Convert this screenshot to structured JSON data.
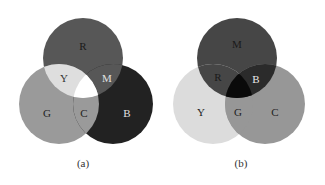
{
  "panels": [
    {
      "caption": "(a)",
      "model": "additive",
      "circles": [
        {
          "id": "R",
          "label": "R",
          "cx": 83,
          "cy": 58,
          "r": 40,
          "fill": "#575757"
        },
        {
          "id": "G",
          "label": "G",
          "cx": 59,
          "cy": 104,
          "r": 40,
          "fill": "#9a9a9a"
        },
        {
          "id": "B",
          "label": "B",
          "cx": 113,
          "cy": 104,
          "r": 40,
          "fill": "#222222"
        }
      ],
      "overlaps": {
        "RG": {
          "label": "Y",
          "fill": "#dedede"
        },
        "RB": {
          "label": "M",
          "fill": "#575757"
        },
        "GB": {
          "label": "C",
          "fill": "#9a9a9a"
        },
        "RGB": {
          "label": "",
          "fill": "#ffffff"
        }
      },
      "labels": [
        {
          "text": "R",
          "x": 83,
          "y": 46,
          "color": "#1a1a1a"
        },
        {
          "text": "Y",
          "x": 64,
          "y": 78,
          "color": "#333333"
        },
        {
          "text": "M",
          "x": 107,
          "y": 78,
          "color": "#e0e0e0"
        },
        {
          "text": "G",
          "x": 47,
          "y": 113,
          "color": "#222222"
        },
        {
          "text": "C",
          "x": 84,
          "y": 113,
          "color": "#222222"
        },
        {
          "text": "B",
          "x": 127,
          "y": 113,
          "color": "#e0e0e0"
        }
      ]
    },
    {
      "caption": "(b)",
      "model": "subtractive",
      "circles": [
        {
          "id": "M",
          "label": "M",
          "cx": 237,
          "cy": 58,
          "r": 40,
          "fill": "#464646"
        },
        {
          "id": "Y",
          "label": "Y",
          "cx": 213,
          "cy": 104,
          "r": 40,
          "fill": "#dcdcdc"
        },
        {
          "id": "C",
          "label": "C",
          "cx": 265,
          "cy": 104,
          "r": 40,
          "fill": "#979797"
        }
      ],
      "overlaps": {
        "MY": {
          "label": "R",
          "fill": "#464646"
        },
        "MC": {
          "label": "B",
          "fill": "#2b2b2b"
        },
        "YC": {
          "label": "G",
          "fill": "#979797"
        },
        "MYC": {
          "label": "",
          "fill": "#0a0a0a"
        }
      },
      "labels": [
        {
          "text": "M",
          "x": 237,
          "y": 44,
          "color": "#1a1a1a"
        },
        {
          "text": "R",
          "x": 218,
          "y": 77,
          "color": "#1a1a1a"
        },
        {
          "text": "B",
          "x": 256,
          "y": 79,
          "color": "#e8e8e8"
        },
        {
          "text": "Y",
          "x": 201,
          "y": 112,
          "color": "#222222"
        },
        {
          "text": "G",
          "x": 238,
          "y": 112,
          "color": "#222222"
        },
        {
          "text": "C",
          "x": 275,
          "y": 112,
          "color": "#222222"
        }
      ]
    }
  ]
}
